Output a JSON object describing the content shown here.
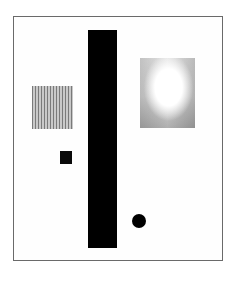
{
  "artwork": {
    "description": "Abstract geometric composition within a rectangular frame",
    "elements": [
      {
        "name": "frame",
        "shape": "rectangle-outline",
        "color": "#6a6a6a"
      },
      {
        "name": "vertical-bar",
        "shape": "rectangle",
        "color": "#000000"
      },
      {
        "name": "striped-square",
        "shape": "square",
        "pattern": "vertical-stripes",
        "color": "#7a7a7a"
      },
      {
        "name": "small-square",
        "shape": "square",
        "color": "#0a0a0a"
      },
      {
        "name": "dot",
        "shape": "circle",
        "color": "#000000"
      },
      {
        "name": "textured-square",
        "shape": "rectangle",
        "pattern": "gray-wash",
        "color": "#c0c0c0"
      }
    ]
  }
}
